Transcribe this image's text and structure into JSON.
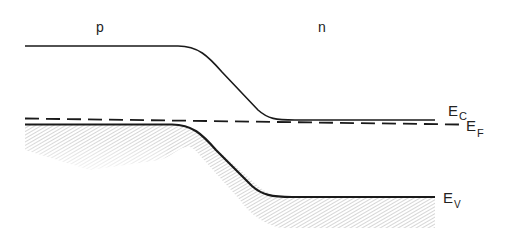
{
  "diagram": {
    "regions": {
      "p": "p",
      "n": "n"
    },
    "bands": {
      "conduction": {
        "symbol": "E",
        "subscript": "C"
      },
      "fermi": {
        "symbol": "E",
        "subscript": "F"
      },
      "valence": {
        "symbol": "E",
        "subscript": "V"
      }
    },
    "colors": {
      "line": "#1a1a1a",
      "shading": "#bdbdbd",
      "background": "#ffffff"
    }
  }
}
